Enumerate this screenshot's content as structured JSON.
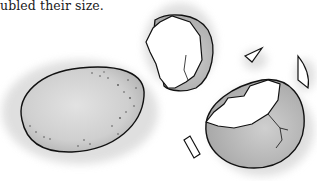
{
  "caption": "ubled their size.",
  "illustration": {
    "subject": "whole egg and cracked egg shells",
    "elements": [
      "whole-egg",
      "eggshell-top-half",
      "eggshell-bottom-half",
      "shell-fragment-1",
      "shell-fragment-2",
      "shell-fragment-3"
    ]
  },
  "colors": {
    "outline": "#111111",
    "shadow": "#d9d9d9",
    "shell": "#c8c8c8",
    "shell_dark": "#9f9f9f",
    "background": "#ffffff"
  }
}
